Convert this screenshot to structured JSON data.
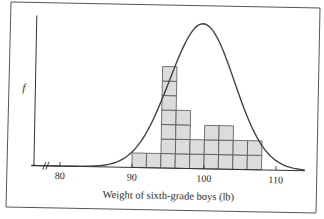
{
  "chart_data": {
    "type": "bar",
    "subtype": "histogram_with_normal_curve_overlay",
    "title": "",
    "xlabel": "Weight of sixth-grade boys (lb)",
    "ylabel": "f",
    "x_ticks": [
      80,
      90,
      100,
      110
    ],
    "x_tick_labels": [
      "80",
      "90",
      "100",
      "110"
    ],
    "axis_break": true,
    "xlim": [
      76,
      114
    ],
    "grid": false,
    "legend": null,
    "bin_width": 2,
    "categories": [
      "90-92",
      "92-94",
      "94-96",
      "96-98",
      "98-100",
      "100-102",
      "102-104",
      "104-106",
      "106-108"
    ],
    "bins": [
      {
        "start": 90,
        "end": 92,
        "count": 1
      },
      {
        "start": 92,
        "end": 94,
        "count": 1
      },
      {
        "start": 94,
        "end": 96,
        "count": 7
      },
      {
        "start": 96,
        "end": 98,
        "count": 4
      },
      {
        "start": 98,
        "end": 100,
        "count": 2
      },
      {
        "start": 100,
        "end": 102,
        "count": 3
      },
      {
        "start": 102,
        "end": 104,
        "count": 3
      },
      {
        "start": 104,
        "end": 106,
        "count": 2
      },
      {
        "start": 106,
        "end": 108,
        "count": 2
      }
    ],
    "values": [
      1,
      1,
      7,
      4,
      2,
      3,
      3,
      2,
      2
    ],
    "series": [
      {
        "name": "Observed frequencies (histogram, unit blocks)",
        "values": [
          1,
          1,
          7,
          4,
          2,
          3,
          3,
          2,
          2
        ]
      },
      {
        "name": "Normal curve",
        "mean": 99.5,
        "sd": 4.5,
        "peak_height_blocks": 10
      }
    ],
    "colors": {
      "bar_fill": "#dcdcdc",
      "bar_stroke": "#555555",
      "curve": "#444444",
      "axis": "#333333",
      "frame": "#555555"
    }
  }
}
